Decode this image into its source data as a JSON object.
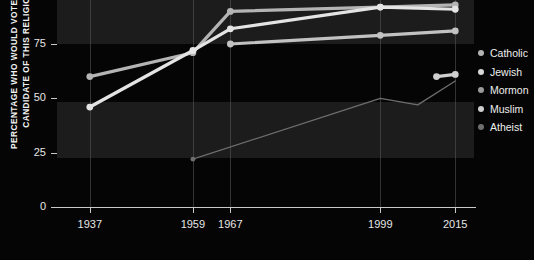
{
  "axes": {
    "y_title_line1": "PERCENTAGE WHO WOULD VOTE FOR A",
    "y_title_line2": "CANDIDATE OF THIS RELIGION",
    "y_ticks": [
      "75",
      "50",
      "25",
      "0"
    ],
    "x_ticks": [
      "1937",
      "1959",
      "1967",
      "1999",
      "2015"
    ]
  },
  "legend": {
    "items": [
      {
        "label": "Catholic",
        "color": "#b4b4b4"
      },
      {
        "label": "Jewish",
        "color": "#d8d8d8"
      },
      {
        "label": "Mormon",
        "color": "#9a9a9a"
      },
      {
        "label": "Muslim",
        "color": "#cfcfcf"
      },
      {
        "label": "Atheist",
        "color": "#6e6e6e"
      }
    ]
  },
  "chart_data": {
    "type": "line",
    "title": "",
    "xlabel": "",
    "ylabel": "PERCENTAGE WHO WOULD VOTE FOR A CANDIDATE OF THIS RELIGION",
    "xlim": [
      1930,
      2019
    ],
    "ylim": [
      0,
      100
    ],
    "grid": "vertical dotted at each x tick; horizontal alternating shaded bands (75-100 and 25-50)",
    "legend_position": "right",
    "x": [
      1937,
      1959,
      1967,
      1999,
      2015
    ],
    "series": [
      {
        "name": "Catholic",
        "color": "#b4b4b4",
        "points": [
          {
            "x": 1937,
            "y": 60
          },
          {
            "x": 1959,
            "y": 71
          },
          {
            "x": 1967,
            "y": 90
          },
          {
            "x": 1999,
            "y": 92
          },
          {
            "x": 2015,
            "y": 93
          }
        ]
      },
      {
        "name": "Jewish",
        "color": "#e4e4e4",
        "points": [
          {
            "x": 1937,
            "y": 46
          },
          {
            "x": 1959,
            "y": 72
          },
          {
            "x": 1967,
            "y": 82
          },
          {
            "x": 1999,
            "y": 92
          },
          {
            "x": 2015,
            "y": 91
          }
        ]
      },
      {
        "name": "Mormon",
        "color": "#c2c2c2",
        "points": [
          {
            "x": 1967,
            "y": 75
          },
          {
            "x": 1999,
            "y": 79
          },
          {
            "x": 2015,
            "y": 81
          }
        ]
      },
      {
        "name": "Muslim",
        "color": "#cfcfcf",
        "points": [
          {
            "x": 2011,
            "y": 60
          },
          {
            "x": 2015,
            "y": 61
          }
        ]
      },
      {
        "name": "Atheist",
        "color": "#6e6e6e",
        "points": [
          {
            "x": 1959,
            "y": 22
          },
          {
            "x": 1999,
            "y": 50
          },
          {
            "x": 2007,
            "y": 47
          },
          {
            "x": 2015,
            "y": 58
          }
        ]
      }
    ]
  }
}
